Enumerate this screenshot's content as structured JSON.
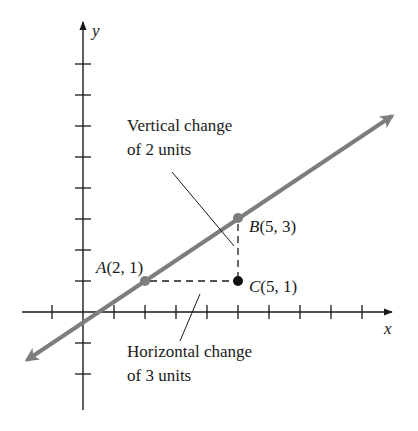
{
  "colors": {
    "axis": "#1a1a1a",
    "line": "#7d7d7d",
    "point_on_line": "#7d7d7d",
    "point_c": "#111111",
    "dashed": "#1a1a1a",
    "callout": "#1a1a1a",
    "background": "#ffffff"
  },
  "axes": {
    "x_label": "x",
    "y_label": "y",
    "origin_px": [
      83,
      312
    ],
    "unit_px": 31,
    "x_ticks": [
      -1,
      1,
      2,
      3,
      4,
      5,
      6,
      7,
      8,
      9
    ],
    "y_ticks": [
      -2,
      -1,
      1,
      2,
      3,
      4,
      5,
      6,
      7,
      8
    ]
  },
  "points": {
    "A": {
      "label": "A(2, 1)",
      "name": "A",
      "coords": "(2, 1)",
      "x": 2,
      "y": 1
    },
    "B": {
      "label": "B(5, 3)",
      "name": "B",
      "coords": "(5, 3)",
      "x": 5,
      "y": 3
    },
    "C": {
      "label": "C(5, 1)",
      "name": "C",
      "coords": "(5, 1)",
      "x": 5,
      "y": 1
    }
  },
  "line": {
    "slope": "2/3",
    "through": [
      "A",
      "B"
    ]
  },
  "annotations": {
    "vertical": {
      "line1": "Vertical change",
      "line2": "of 2 units"
    },
    "horizontal": {
      "line1": "Horizontal change",
      "line2": "of 3 units"
    }
  }
}
